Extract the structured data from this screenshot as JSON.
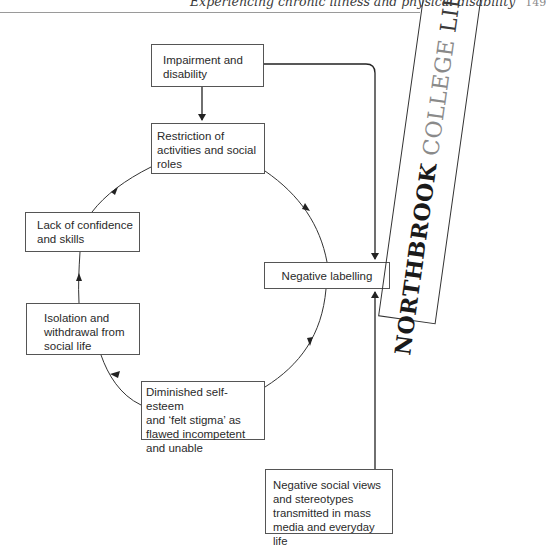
{
  "header": {
    "running_title": "Experiencing chronic illness and physical disability",
    "page_number": "149"
  },
  "stamp": {
    "word1": "NORTHBROOK",
    "word2": "COLLEGE",
    "word3": "LIBRARY"
  },
  "diagram": {
    "nodes": {
      "impairment": "Impairment and disability",
      "restriction": "Restriction of activities and social roles",
      "negative_labelling": "Negative labelling",
      "diminished": "Diminished self-esteem and ‘felt stigma’ as flawed incompetent and unable",
      "isolation": "Isolation and withdrawal from social life",
      "lack": "Lack of confidence and skills",
      "negative_social": "Negative social views and stereotypes transmitted in mass media and everyday life"
    },
    "node_lines": {
      "impairment": [
        "Impairment and",
        "disability"
      ],
      "restriction": [
        "Restriction of",
        "activities and social",
        "roles"
      ],
      "negative_labelling": [
        "Negative labelling"
      ],
      "diminished": [
        "Diminished self-esteem",
        "and ‘felt stigma’ as",
        "flawed incompetent",
        "and unable"
      ],
      "isolation": [
        "Isolation and",
        "withdrawal from",
        "social life"
      ],
      "lack": [
        "Lack of confidence",
        "and skills"
      ],
      "negative_social": [
        "Negative social views",
        "and stereotypes",
        "transmitted in mass",
        "media and everyday life"
      ]
    },
    "edges": [
      {
        "from": "impairment",
        "to": "restriction"
      },
      {
        "from": "impairment",
        "to": "negative_labelling"
      },
      {
        "from": "restriction",
        "to": "negative_labelling"
      },
      {
        "from": "negative_labelling",
        "to": "diminished"
      },
      {
        "from": "diminished",
        "to": "isolation"
      },
      {
        "from": "isolation",
        "to": "lack"
      },
      {
        "from": "lack",
        "to": "restriction"
      },
      {
        "from": "negative_social",
        "to": "negative_labelling"
      }
    ]
  }
}
